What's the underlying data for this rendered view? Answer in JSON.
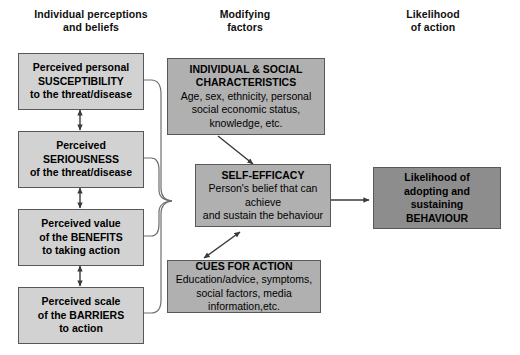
{
  "columns": [
    {
      "id": "col-individual",
      "title_line1": "Individual perceptions",
      "title_line2": "and beliefs"
    },
    {
      "id": "col-modifying",
      "title_line1": "Modifying",
      "title_line2": "factors"
    },
    {
      "id": "col-likelihood",
      "title_line1": "Likelihood",
      "title_line2": "of action"
    }
  ],
  "nodes": {
    "susceptibility": {
      "line1": "Perceived personal",
      "line2": "SUSCEPTIBILITY",
      "line3": "to the threat/disease"
    },
    "seriousness": {
      "line1": "Perceived",
      "line2": "SERIOUSNESS",
      "line3": "of the threat/disease"
    },
    "benefits": {
      "line1": "Perceived value",
      "line2": "of the BENEFITS",
      "line3": "to taking action"
    },
    "barriers": {
      "line1": "Perceived scale",
      "line2": "of the BARRIERS",
      "line3": "to action"
    },
    "characteristics": {
      "title_line1": "INDIVIDUAL & SOCIAL",
      "title_line2": "CHARACTERISTICS",
      "body_line1": "Age, sex, ethnicity, personal",
      "body_line2": "social economic status,",
      "body_line3": "knowledge, etc."
    },
    "self_efficacy": {
      "title": "SELF-EFFICACY",
      "body_line1": "Person's belief that can achieve",
      "body_line2": "and sustain the behaviour"
    },
    "cues": {
      "title": "CUES FOR ACTION",
      "body_line1": "Education/advice, symptoms,",
      "body_line2": "social factors, media",
      "body_line3": "information,etc."
    },
    "likelihood": {
      "line1": "Likelihood of",
      "line2": "adopting and sustaining",
      "line3": "BEHAVIOUR"
    }
  },
  "colors": {
    "box_light": "#d2d2d2",
    "box_mid": "#b0b0b0",
    "box_dark": "#8d8d8d",
    "border": "#58585a",
    "line": "#3a3a3a",
    "text": "#000000",
    "background": "#ffffff"
  }
}
